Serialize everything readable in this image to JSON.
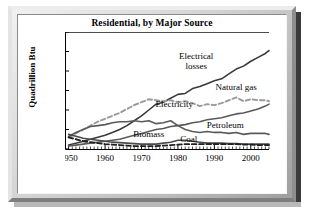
{
  "chart_data": {
    "type": "line",
    "title": "Residential, by Major Source",
    "xlabel": "",
    "ylabel": "Quadrillion Btu",
    "xlim": [
      1949,
      2005
    ],
    "ylim": [
      0,
      12
    ],
    "ytick_labels": [
      "0",
      "2",
      "4",
      "6",
      "8",
      "10",
      "12"
    ],
    "yticks": [
      0,
      2,
      4,
      6,
      8,
      10,
      12
    ],
    "xtick_labels": [
      "1950",
      "1960",
      "1970",
      "1980",
      "1990",
      "2000"
    ],
    "xticks": [
      1950,
      1960,
      1970,
      1980,
      1990,
      2000
    ],
    "minor_xtick_interval": 1,
    "grid": false,
    "legend": "inline-annotations",
    "x": [
      1950,
      1952,
      1954,
      1956,
      1958,
      1960,
      1962,
      1964,
      1966,
      1968,
      1970,
      1972,
      1974,
      1976,
      1978,
      1980,
      1982,
      1984,
      1986,
      1988,
      1990,
      1992,
      1994,
      1996,
      1998,
      2000,
      2002,
      2004,
      2005
    ],
    "series": [
      {
        "name": "Electrical losses",
        "style": "solid",
        "color": "#3a3a3a",
        "label_x": 1985,
        "label_y": 9.2,
        "values": [
          0.4,
          0.6,
          0.8,
          1.0,
          1.2,
          1.4,
          1.7,
          2.0,
          2.4,
          2.9,
          3.4,
          4.0,
          4.6,
          4.8,
          5.2,
          5.6,
          5.7,
          6.2,
          6.4,
          6.7,
          7.0,
          7.2,
          7.7,
          8.2,
          8.5,
          9.0,
          9.4,
          9.8,
          10.1
        ]
      },
      {
        "name": "Natural gas",
        "style": "dashed",
        "color": "#9a9a9a",
        "label_x": 1996,
        "label_y": 6.1,
        "values": [
          1.2,
          1.6,
          2.0,
          2.4,
          2.8,
          3.1,
          3.4,
          3.7,
          4.1,
          4.5,
          4.8,
          5.1,
          5.0,
          4.9,
          5.0,
          4.8,
          4.9,
          4.7,
          4.4,
          4.6,
          4.5,
          4.7,
          5.0,
          5.3,
          4.9,
          5.1,
          5.0,
          5.0,
          4.9
        ]
      },
      {
        "name": "Electricity",
        "style": "solid",
        "color": "#5a5a5a",
        "label_x": 1979,
        "label_y": 4.3,
        "values": [
          0.3,
          0.4,
          0.5,
          0.6,
          0.7,
          0.8,
          0.9,
          1.0,
          1.2,
          1.4,
          1.6,
          1.8,
          2.0,
          2.1,
          2.3,
          2.4,
          2.5,
          2.7,
          2.8,
          3.0,
          3.1,
          3.2,
          3.4,
          3.6,
          3.7,
          3.9,
          4.1,
          4.4,
          4.6
        ]
      },
      {
        "name": "Petroleum",
        "style": "solid",
        "color": "#5a5a5a",
        "label_x": 1993,
        "label_y": 2.2,
        "values": [
          1.3,
          1.7,
          2.0,
          2.3,
          2.4,
          2.5,
          2.7,
          2.8,
          2.8,
          2.9,
          2.8,
          2.9,
          2.6,
          2.7,
          2.9,
          2.4,
          2.0,
          1.8,
          1.7,
          1.8,
          1.7,
          1.7,
          1.6,
          1.7,
          1.5,
          1.6,
          1.6,
          1.6,
          1.5
        ]
      },
      {
        "name": "Biomass",
        "style": "solid",
        "color": "#4a4a4a",
        "label_x": 1972,
        "label_y": 1.25,
        "values": [
          1.5,
          1.3,
          1.1,
          1.0,
          0.9,
          0.8,
          0.7,
          0.65,
          0.6,
          0.55,
          0.5,
          0.5,
          0.5,
          0.6,
          0.7,
          0.9,
          0.9,
          0.8,
          0.7,
          0.6,
          0.6,
          0.6,
          0.55,
          0.55,
          0.5,
          0.5,
          0.5,
          0.5,
          0.5
        ]
      },
      {
        "name": "Coal",
        "style": "dashed",
        "color": "#1f1f1f",
        "label_x": 1983,
        "label_y": 0.72,
        "values": [
          1.2,
          1.0,
          0.8,
          0.7,
          0.6,
          0.5,
          0.45,
          0.4,
          0.35,
          0.3,
          0.3,
          0.3,
          0.3,
          0.35,
          0.4,
          0.45,
          0.5,
          0.5,
          0.5,
          0.5,
          0.5,
          0.5,
          0.5,
          0.5,
          0.45,
          0.45,
          0.4,
          0.4,
          0.4
        ]
      }
    ]
  }
}
